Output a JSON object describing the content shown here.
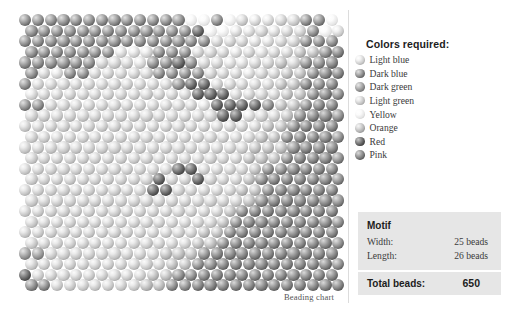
{
  "chart": {
    "caption": "Beading chart",
    "grid": {
      "columns": 25,
      "rows": 26,
      "stitch": "brick",
      "palette": [
        {
          "index": 0,
          "name": "Light blue",
          "swatch": "#c9c9c9"
        },
        {
          "index": 1,
          "name": "Dark blue",
          "swatch": "#7e7e7e"
        },
        {
          "index": 2,
          "name": "Dark green",
          "swatch": "#8d8d8d"
        },
        {
          "index": 3,
          "name": "Light green",
          "swatch": "#c0c0c0"
        },
        {
          "index": 4,
          "name": "Yellow",
          "swatch": "#e4e4e4"
        },
        {
          "index": 5,
          "name": "Orange",
          "swatch": "#aeaeae"
        },
        {
          "index": 6,
          "name": "Red",
          "swatch": "#5c5c5c"
        },
        {
          "index": 7,
          "name": "Pink",
          "swatch": "#757575"
        }
      ],
      "cells": [
        [
          1,
          1,
          1,
          1,
          1,
          1,
          1,
          1,
          1,
          1,
          1,
          1,
          1,
          4,
          4,
          1,
          4,
          3,
          0,
          0,
          3,
          3,
          1,
          1,
          4
        ],
        [
          1,
          1,
          1,
          1,
          1,
          1,
          1,
          1,
          1,
          1,
          1,
          1,
          1,
          6,
          4,
          4,
          0,
          0,
          3,
          0,
          3,
          3,
          1,
          4,
          0
        ],
        [
          1,
          1,
          1,
          1,
          1,
          1,
          1,
          1,
          1,
          1,
          1,
          1,
          1,
          1,
          1,
          3,
          3,
          3,
          0,
          0,
          3,
          3,
          1,
          1,
          1
        ],
        [
          1,
          1,
          1,
          1,
          1,
          1,
          1,
          0,
          0,
          0,
          1,
          1,
          1,
          3,
          3,
          3,
          0,
          3,
          0,
          3,
          3,
          5,
          5,
          1,
          7
        ],
        [
          1,
          1,
          1,
          1,
          1,
          1,
          3,
          3,
          3,
          0,
          1,
          1,
          6,
          1,
          3,
          3,
          0,
          0,
          3,
          3,
          5,
          3,
          1,
          1,
          7
        ],
        [
          1,
          3,
          0,
          1,
          1,
          3,
          3,
          3,
          3,
          3,
          1,
          1,
          1,
          1,
          3,
          3,
          3,
          0,
          3,
          3,
          5,
          5,
          1,
          7,
          7
        ],
        [
          1,
          3,
          3,
          3,
          3,
          3,
          3,
          3,
          3,
          3,
          3,
          3,
          1,
          6,
          6,
          3,
          3,
          3,
          3,
          3,
          5,
          5,
          7,
          1,
          7
        ],
        [
          0,
          3,
          3,
          3,
          3,
          3,
          3,
          3,
          3,
          3,
          3,
          3,
          3,
          6,
          6,
          6,
          3,
          3,
          3,
          3,
          5,
          5,
          1,
          7,
          1
        ],
        [
          1,
          1,
          3,
          3,
          3,
          3,
          3,
          3,
          3,
          3,
          3,
          3,
          3,
          3,
          0,
          6,
          6,
          6,
          6,
          1,
          5,
          5,
          1,
          7,
          7
        ],
        [
          3,
          3,
          3,
          3,
          3,
          3,
          3,
          3,
          3,
          3,
          3,
          3,
          3,
          3,
          3,
          6,
          6,
          0,
          3,
          3,
          5,
          1,
          7,
          7,
          1
        ],
        [
          3,
          3,
          3,
          3,
          3,
          3,
          3,
          3,
          3,
          3,
          3,
          3,
          3,
          3,
          3,
          3,
          3,
          3,
          3,
          5,
          5,
          1,
          7,
          7,
          7
        ],
        [
          3,
          3,
          3,
          3,
          3,
          3,
          3,
          3,
          3,
          3,
          3,
          3,
          3,
          3,
          3,
          3,
          3,
          3,
          5,
          5,
          1,
          7,
          7,
          7,
          1
        ],
        [
          3,
          3,
          3,
          3,
          3,
          3,
          3,
          3,
          3,
          3,
          3,
          3,
          3,
          3,
          3,
          3,
          3,
          3,
          5,
          5,
          5,
          1,
          7,
          7,
          7
        ],
        [
          3,
          3,
          3,
          3,
          3,
          3,
          3,
          3,
          3,
          3,
          3,
          3,
          3,
          3,
          3,
          3,
          3,
          5,
          5,
          5,
          1,
          7,
          7,
          7,
          1
        ],
        [
          3,
          3,
          3,
          3,
          3,
          3,
          3,
          3,
          3,
          3,
          3,
          3,
          6,
          6,
          3,
          3,
          3,
          3,
          5,
          1,
          1,
          7,
          7,
          7,
          7
        ],
        [
          3,
          3,
          3,
          3,
          3,
          3,
          3,
          3,
          3,
          3,
          6,
          3,
          3,
          6,
          3,
          3,
          3,
          5,
          1,
          7,
          7,
          7,
          7,
          7,
          1
        ],
        [
          3,
          3,
          3,
          3,
          3,
          3,
          3,
          3,
          3,
          3,
          6,
          6,
          3,
          3,
          3,
          3,
          3,
          5,
          5,
          1,
          7,
          7,
          7,
          7,
          7
        ],
        [
          3,
          3,
          3,
          3,
          3,
          3,
          3,
          3,
          3,
          3,
          3,
          3,
          3,
          3,
          3,
          3,
          3,
          5,
          1,
          7,
          7,
          7,
          7,
          7,
          1
        ],
        [
          3,
          3,
          3,
          3,
          3,
          3,
          3,
          3,
          3,
          3,
          3,
          3,
          3,
          3,
          3,
          3,
          5,
          1,
          7,
          7,
          7,
          7,
          7,
          7,
          7
        ],
        [
          3,
          3,
          3,
          3,
          3,
          3,
          3,
          3,
          3,
          3,
          3,
          3,
          3,
          3,
          3,
          5,
          1,
          7,
          7,
          7,
          7,
          7,
          7,
          7,
          1
        ],
        [
          3,
          3,
          3,
          3,
          3,
          3,
          3,
          3,
          3,
          3,
          3,
          3,
          3,
          3,
          5,
          5,
          1,
          7,
          7,
          7,
          7,
          7,
          7,
          7,
          7
        ],
        [
          3,
          3,
          3,
          3,
          3,
          3,
          3,
          3,
          3,
          3,
          3,
          3,
          3,
          5,
          5,
          1,
          7,
          7,
          7,
          7,
          7,
          7,
          7,
          7,
          1
        ],
        [
          2,
          2,
          3,
          3,
          3,
          3,
          3,
          3,
          3,
          3,
          3,
          5,
          5,
          5,
          1,
          7,
          7,
          7,
          7,
          7,
          7,
          7,
          7,
          7,
          7
        ],
        [
          3,
          3,
          3,
          3,
          3,
          3,
          3,
          3,
          3,
          3,
          3,
          5,
          5,
          1,
          1,
          7,
          7,
          7,
          7,
          7,
          7,
          7,
          7,
          7,
          1
        ],
        [
          6,
          3,
          3,
          3,
          3,
          3,
          3,
          3,
          3,
          3,
          5,
          5,
          1,
          1,
          7,
          7,
          7,
          7,
          7,
          7,
          7,
          7,
          7,
          7,
          7
        ],
        [
          1,
          1,
          3,
          3,
          3,
          3,
          3,
          3,
          3,
          5,
          5,
          1,
          1,
          7,
          7,
          7,
          7,
          7,
          7,
          7,
          7,
          7,
          7,
          7,
          7
        ]
      ]
    }
  },
  "legend": {
    "title": "Colors required:",
    "items": [
      {
        "label": "Light blue"
      },
      {
        "label": "Dark blue"
      },
      {
        "label": "Dark green"
      },
      {
        "label": "Light green"
      },
      {
        "label": "Yellow"
      },
      {
        "label": "Orange"
      },
      {
        "label": "Red"
      },
      {
        "label": "Pink"
      }
    ]
  },
  "motif": {
    "heading": "Motif",
    "width_label": "Width:",
    "width_value": "25 beads",
    "length_label": "Length:",
    "length_value": "26 beads",
    "total_label": "Total beads:",
    "total_value": "650"
  }
}
